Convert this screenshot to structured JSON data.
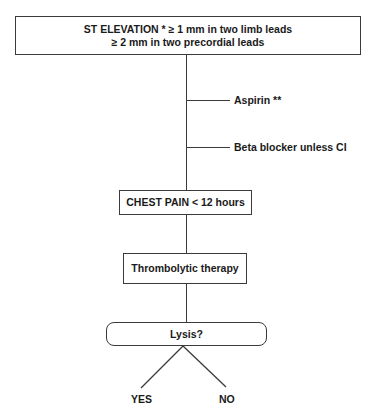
{
  "diagram": {
    "type": "flowchart",
    "nodes": {
      "st_elevation": {
        "line1": "ST ELEVATION * ≥ 1 mm in two limb leads",
        "line2": "≥ 2 mm in two precordial leads"
      },
      "chest_pain": {
        "label": "CHEST PAIN < 12 hours"
      },
      "thrombolytic": {
        "label": "Thrombolytic therapy"
      },
      "lysis": {
        "label": "Lysis?"
      }
    },
    "side_branches": [
      {
        "label": "Aspirin **"
      },
      {
        "label": "Beta blocker unless CI"
      }
    ],
    "outcomes": {
      "yes": "YES",
      "no": "NO"
    },
    "edges": [
      {
        "from": "st_elevation",
        "to": "chest_pain"
      },
      {
        "from": "chest_pain",
        "to": "thrombolytic"
      },
      {
        "from": "thrombolytic",
        "to": "lysis"
      },
      {
        "from": "lysis",
        "to": "yes"
      },
      {
        "from": "lysis",
        "to": "no"
      }
    ],
    "colors": {
      "line": "#3a3a3a",
      "text": "#1a1a1a",
      "background": "#ffffff"
    }
  }
}
